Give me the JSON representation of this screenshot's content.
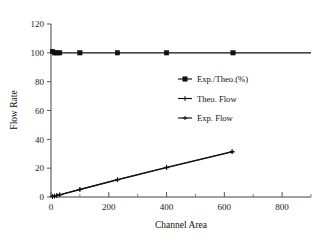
{
  "figure": {
    "background": "#ffffff",
    "ink_color": "#111111"
  },
  "chart_data": {
    "type": "line",
    "title": "",
    "xlabel": "Channel Area",
    "ylabel": "Flow Rate",
    "xlim": [
      0,
      900
    ],
    "ylim": [
      0,
      120
    ],
    "xticks": [
      0,
      200,
      400,
      600,
      800
    ],
    "yticks": [
      0,
      20,
      40,
      60,
      80,
      100,
      120
    ],
    "xtick_labels": [
      "0",
      "200",
      "400",
      "600",
      "800"
    ],
    "ytick_labels": [
      "0",
      "20",
      "40",
      "60",
      "80",
      "100",
      "120"
    ],
    "minor_xticks": [
      100,
      300,
      500,
      700,
      900
    ],
    "grid": false,
    "legend_position": "center-right",
    "series": [
      {
        "name": "Exp./Theo.(%)",
        "marker": "filled-square",
        "x": [
          5,
          12,
          20,
          30,
          100,
          230,
          400,
          630,
          900
        ],
        "y": [
          101,
          100,
          100,
          100,
          100,
          100,
          100,
          100,
          100
        ]
      },
      {
        "name": "Theo. Flow",
        "marker": "cross",
        "x": [
          5,
          12,
          20,
          30,
          100,
          230,
          400,
          627
        ],
        "y": [
          0.3,
          0.7,
          1.1,
          1.6,
          5.3,
          12.1,
          20.6,
          31.6
        ]
      },
      {
        "name": "Exp. Flow",
        "marker": "plus",
        "x": [
          5,
          12,
          20,
          30,
          100,
          230,
          400,
          627
        ],
        "y": [
          0.3,
          0.6,
          1.0,
          1.5,
          5.1,
          11.9,
          20.3,
          31.2
        ]
      }
    ]
  },
  "legend": {
    "entries": [
      {
        "label": "Exp./Theo.(%)",
        "marker": "filled-square"
      },
      {
        "label": "Theo. Flow",
        "marker": "cross"
      },
      {
        "label": "Exp. Flow",
        "marker": "plus"
      }
    ]
  }
}
